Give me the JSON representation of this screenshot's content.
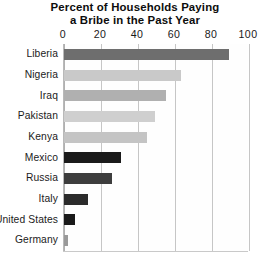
{
  "chart_data": {
    "type": "bar",
    "orientation": "horizontal",
    "title": "Percent of Households Paying a Bribe in the Past Year",
    "title_lines": [
      "Percent of Households Paying",
      "a Bribe in the Past Year"
    ],
    "xlabel": "",
    "ylabel": "",
    "xlim": [
      0,
      100
    ],
    "xticks": [
      0,
      20,
      40,
      60,
      80,
      100
    ],
    "xtick_labels": [
      "0",
      "20",
      "40",
      "60",
      "80",
      "100"
    ],
    "grid": true,
    "grid_axis": "x",
    "legend": false,
    "axis_position": "top",
    "categories": [
      "Liberia",
      "Nigeria",
      "Iraq",
      "Pakistan",
      "Kenya",
      "Mexico",
      "Russia",
      "Italy",
      "United States",
      "Germany"
    ],
    "values": [
      89,
      63,
      55,
      49,
      45,
      31,
      26,
      13,
      6,
      2
    ],
    "bar_colors": [
      "#6e6e6e",
      "#c9c9c9",
      "#b0b0b0",
      "#cfcfcf",
      "#c4c4c4",
      "#1a1a1a",
      "#3d3d3d",
      "#2b2b2b",
      "#1a1a1a",
      "#9a9a9a"
    ]
  },
  "caption": {
    "text": ""
  },
  "colors": {
    "background": "#ffffff",
    "gridline": "#c6c6c6",
    "axis": "#b0b0b0",
    "text": "#1a1a1a",
    "title": "#0d0d0d"
  }
}
